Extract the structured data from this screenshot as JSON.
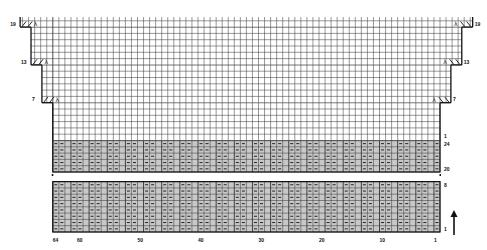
{
  "chart": {
    "stitch_count": 64,
    "colors": {
      "grid_line": "#333333",
      "border": "#111111",
      "rib_fill": "#c8c8c8",
      "plain_fill": "#ffffff",
      "purl_mark": "#222222"
    },
    "column_labels": [
      {
        "text": "64",
        "col": 64
      },
      {
        "text": "60",
        "col": 60
      },
      {
        "text": "50",
        "col": 50
      },
      {
        "text": "40",
        "col": 40
      },
      {
        "text": "30",
        "col": 30
      },
      {
        "text": "20",
        "col": 20
      },
      {
        "text": "10",
        "col": 10
      },
      {
        "text": "1",
        "col": 1
      }
    ],
    "lower_rib_section": {
      "row_labels": [
        "1",
        "8"
      ],
      "rows": 8
    },
    "upper_rib_section": {
      "row_labels": [
        "20",
        "24"
      ],
      "rows": 5
    },
    "body_section": {
      "row_labels_right": [
        "1",
        "7",
        "13",
        "19"
      ],
      "row_labels_left": [
        "7",
        "13",
        "19"
      ]
    },
    "decrease_rows": [
      {
        "row": "7",
        "left_symbol": "//λ",
        "right_symbol": "λ\\\\"
      },
      {
        "row": "13",
        "left_symbol": "//λ",
        "right_symbol": "λ\\\\"
      },
      {
        "row": "19",
        "left_symbol": "//λ",
        "right_symbol": "λ\\\\"
      }
    ],
    "direction_arrow": "up-arrow"
  }
}
